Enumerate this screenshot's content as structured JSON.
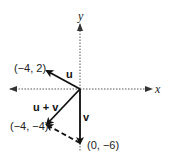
{
  "diagram": {
    "type": "vector-addition",
    "axes": {
      "x_label": "x",
      "y_label": "y"
    },
    "vectors": [
      {
        "name": "u",
        "label": "u",
        "components": [
          -4,
          2
        ],
        "tip_label": "(−4, 2)",
        "style": "solid"
      },
      {
        "name": "v",
        "label": "v",
        "components": [
          0,
          -6
        ],
        "tip_label": "(0, −6)",
        "style": "solid"
      },
      {
        "name": "u_plus_v",
        "label": "u + v",
        "components": [
          -4,
          -4
        ],
        "tip_label": "(−4, −4)",
        "style": "solid"
      },
      {
        "name": "u_translated",
        "label": "",
        "from": [
          0,
          -6
        ],
        "to": [
          -4,
          -4
        ],
        "style": "dashed"
      }
    ],
    "colors": {
      "line": "#111111",
      "axis": "#555555",
      "background": "#ffffff"
    }
  }
}
